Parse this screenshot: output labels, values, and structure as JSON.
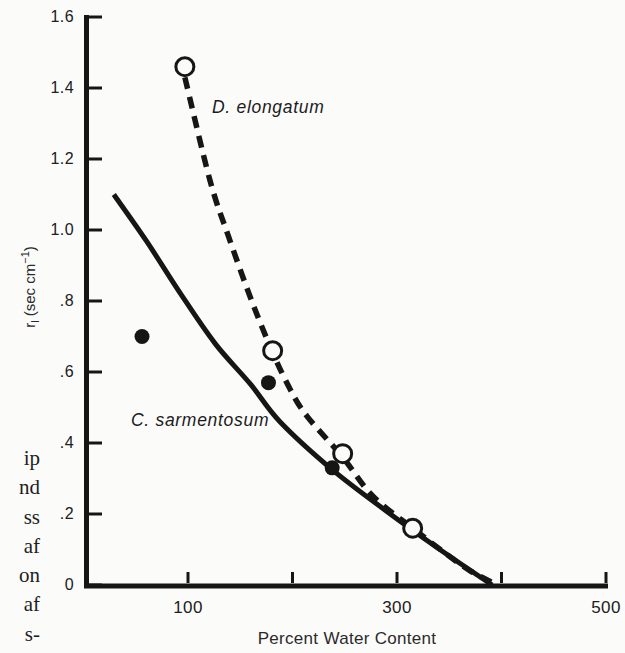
{
  "caption_fragments": [
    "ip",
    "nd",
    "ss",
    "af",
    "on",
    "af",
    "s-"
  ],
  "chart_data": {
    "type": "line",
    "title": "",
    "xlabel": "Percent Water Content",
    "ylabel": "rl (sec cm−1)",
    "ylabel_parts": {
      "symbol": "r",
      "symbol_sub": "l",
      "unit_open": " (sec cm",
      "unit_exp": "−1",
      "unit_close": ")"
    },
    "xlim": [
      0,
      500
    ],
    "ylim": [
      0,
      1.6
    ],
    "grid": false,
    "legend": "inline-curve-labels",
    "x_ticks": [
      {
        "v": 100,
        "label": "100"
      },
      {
        "v": 200,
        "label": ""
      },
      {
        "v": 300,
        "label": "300"
      },
      {
        "v": 400,
        "label": ""
      },
      {
        "v": 500,
        "label": "500"
      }
    ],
    "y_ticks": [
      {
        "v": 0.0,
        "label": "0"
      },
      {
        "v": 0.2,
        "label": ".2"
      },
      {
        "v": 0.4,
        "label": ".4"
      },
      {
        "v": 0.6,
        "label": ".6"
      },
      {
        "v": 0.8,
        "label": ".8"
      },
      {
        "v": 1.0,
        "label": "1.0"
      },
      {
        "v": 1.2,
        "label": "1.2"
      },
      {
        "v": 1.4,
        "label": "1.4"
      },
      {
        "v": 1.6,
        "label": "1.6"
      }
    ],
    "colors": {
      "ink": "#161616",
      "background": "#fbfbfa",
      "open_marker_fill": "#fbfbfa"
    },
    "series": [
      {
        "name": "D. elongatum",
        "line_style": "dashed",
        "marker": "open-circle",
        "points": [
          [
            97,
            1.46
          ],
          [
            181,
            0.66
          ],
          [
            248,
            0.37
          ],
          [
            315,
            0.16
          ]
        ],
        "curve_fit": [
          [
            97,
            1.43
          ],
          [
            121,
            1.14
          ],
          [
            139,
            0.98
          ],
          [
            161,
            0.8
          ],
          [
            181,
            0.655
          ],
          [
            198,
            0.55
          ],
          [
            214,
            0.475
          ],
          [
            248,
            0.36
          ],
          [
            277,
            0.25
          ],
          [
            315,
            0.16
          ],
          [
            346,
            0.09
          ],
          [
            370,
            0.04
          ],
          [
            396,
            0
          ]
        ]
      },
      {
        "name": "C. sarmentosum",
        "line_style": "solid",
        "marker": "filled-circle",
        "points": [
          [
            56,
            0.7
          ],
          [
            177,
            0.57
          ],
          [
            238,
            0.33
          ]
        ],
        "curve_fit": [
          [
            29,
            1.1
          ],
          [
            60,
            0.97
          ],
          [
            93,
            0.82
          ],
          [
            126,
            0.68
          ],
          [
            160,
            0.565
          ],
          [
            188,
            0.46
          ],
          [
            238,
            0.325
          ],
          [
            289,
            0.21
          ],
          [
            341,
            0.1
          ],
          [
            391,
            0
          ]
        ]
      }
    ]
  }
}
